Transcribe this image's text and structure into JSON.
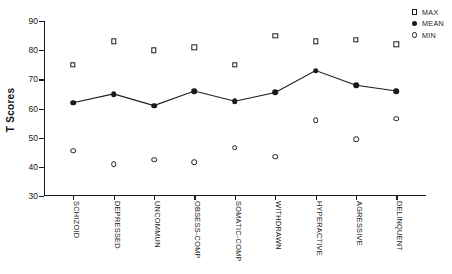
{
  "chart_data": {
    "type": "scatter",
    "title": "",
    "xlabel": "",
    "ylabel": "T Scores",
    "ylim": [
      30,
      90
    ],
    "yticks": [
      30,
      40,
      50,
      60,
      70,
      80,
      90
    ],
    "grid": false,
    "legend_position": "top-right",
    "categories": [
      "SCHIZOID",
      "DEPRESSED",
      "UNCOMMUN",
      "OBSESS-COMP",
      "SOMATIC-COMP",
      "WITHDRAWN",
      "HYPERACTIVE",
      "AGRESSIVE",
      "DELINQUENT"
    ],
    "series": [
      {
        "name": "MAX",
        "marker": "open-square",
        "line": false,
        "values": [
          75,
          83,
          80,
          81,
          75,
          85,
          83,
          83.5,
          82
        ]
      },
      {
        "name": "MEAN",
        "marker": "filled-circle",
        "line": true,
        "values": [
          62,
          65,
          61,
          66,
          62.5,
          65.5,
          73,
          68,
          66
        ]
      },
      {
        "name": "MIN",
        "marker": "open-circle",
        "line": false,
        "values": [
          45.5,
          41,
          42.5,
          41.5,
          46.5,
          43.5,
          56,
          49.5,
          56.5
        ]
      }
    ]
  },
  "legend": {
    "items": [
      {
        "label": "MAX",
        "symbol": "open-square"
      },
      {
        "label": "MEAN",
        "symbol": "filled-circle"
      },
      {
        "label": "MIN",
        "symbol": "open-circle"
      }
    ]
  }
}
